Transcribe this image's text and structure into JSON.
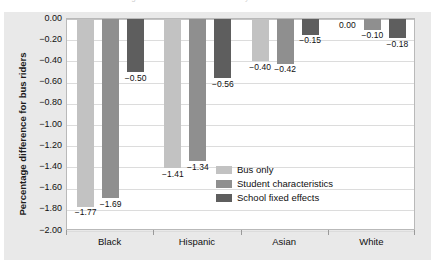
{
  "figure": {
    "background_color": "#e9e9e9",
    "plot_background_color": "#ffffff",
    "caption_remnant": "Percentage difference for bus riders by race"
  },
  "chart_data": {
    "type": "bar",
    "title": "",
    "xlabel": "",
    "ylabel": "Percentage difference for bus riders",
    "categories": [
      "Black",
      "Hispanic",
      "Asian",
      "White"
    ],
    "ylim": [
      -2.0,
      0.0
    ],
    "ytick_labels": [
      "0.00",
      "-0.20",
      "-0.40",
      "-0.60",
      "-0.80",
      "-1.00",
      "-1.20",
      "-1.40",
      "-1.60",
      "-1.80",
      "-2.00"
    ],
    "ytick_values": [
      0.0,
      -0.2,
      -0.4,
      -0.6,
      -0.8,
      -1.0,
      -1.2,
      -1.4,
      -1.6,
      -1.8,
      -2.0
    ],
    "grid": true,
    "legend_position": "inside lower-right",
    "series": [
      {
        "name": "Bus only",
        "color": "#c2c2c2",
        "values": [
          -1.77,
          -1.41,
          -0.4,
          0.0
        ],
        "labels": [
          "-1.77",
          "-1.41",
          "-0.40",
          "0.00"
        ]
      },
      {
        "name": "Student characteristics",
        "color": "#8f8f8f",
        "values": [
          -1.69,
          -1.34,
          -0.42,
          -0.1
        ],
        "labels": [
          "-1.69",
          "-1.34",
          "-0.42",
          "-0.10"
        ]
      },
      {
        "name": "School fixed effects",
        "color": "#5e5e5e",
        "values": [
          -0.5,
          -0.56,
          -0.15,
          -0.18
        ],
        "labels": [
          "-0.50",
          "-0.56",
          "-0.15",
          "-0.18"
        ]
      }
    ]
  }
}
